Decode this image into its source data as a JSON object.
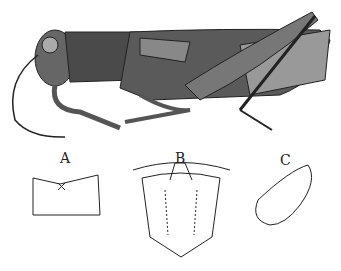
{
  "figure": {
    "labels": {
      "a": "A",
      "b": "B",
      "c": "C"
    },
    "colors": {
      "ink": "#222222",
      "background": "#ffffff"
    }
  }
}
